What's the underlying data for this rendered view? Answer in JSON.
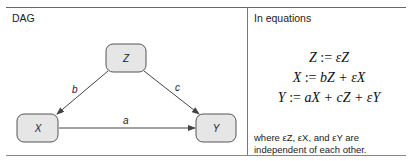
{
  "left_panel": {
    "title": "DAG",
    "nodes": [
      {
        "id": "Z",
        "label": "Z"
      },
      {
        "id": "X",
        "label": "X"
      },
      {
        "id": "Y",
        "label": "Y"
      }
    ],
    "edges": [
      {
        "from": "Z",
        "to": "X",
        "label": "b"
      },
      {
        "from": "Z",
        "to": "Y",
        "label": "c"
      },
      {
        "from": "X",
        "to": "Y",
        "label": "a"
      }
    ]
  },
  "right_panel": {
    "title": "In equations",
    "equations": [
      {
        "lhs": "Z",
        "rhs": "εZ"
      },
      {
        "lhs": "X",
        "rhs": "bZ + εX"
      },
      {
        "lhs": "Y",
        "rhs": "aX + cZ + εY"
      }
    ],
    "note_line1": "where εZ, εX, and εY are",
    "note_line2": "independent of each other."
  },
  "colors": {
    "node_fill": "#e6e6e6",
    "node_stroke": "#555555",
    "edge": "#444444"
  }
}
